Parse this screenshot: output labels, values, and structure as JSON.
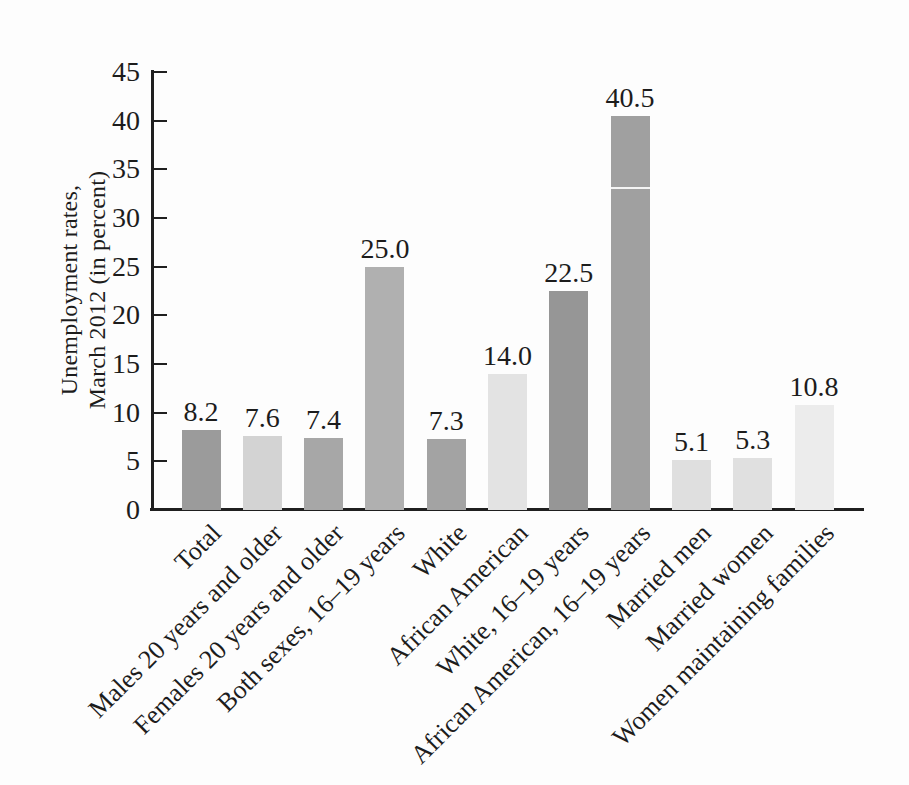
{
  "figure": {
    "background": "#fdfdfd",
    "axis_color": "#1f1f1f",
    "text_color": "#1c1c1c"
  },
  "chart_data": {
    "type": "bar",
    "title": "",
    "xlabel": "",
    "ylabel": "Unemployment rates, March 2012 (in percent)",
    "ylabel_lines": [
      "Unemployment rates,",
      "March 2012 (in percent)"
    ],
    "ylim": [
      0,
      45
    ],
    "ytick_interval": 5,
    "yticks": [
      0,
      5,
      10,
      15,
      20,
      25,
      30,
      35,
      40,
      45
    ],
    "grid": false,
    "legend": "none",
    "categories": [
      "Total",
      "Males 20 years and older",
      "Females 20 years and older",
      "Both sexes, 16–19 years",
      "White",
      "African American",
      "White, 16–19 years",
      "African American, 16–19 years",
      "Married men",
      "Married women",
      "Women maintaining families"
    ],
    "values": [
      8.2,
      7.6,
      7.4,
      25.0,
      7.3,
      14.0,
      22.5,
      40.5,
      5.1,
      5.3,
      10.8
    ],
    "value_labels": [
      "8.2",
      "7.6",
      "7.4",
      "25.0",
      "7.3",
      "14.0",
      "22.5",
      "40.5",
      "5.1",
      "5.3",
      "10.8"
    ],
    "bar_colors": [
      "#9b9b9b",
      "#d3d3d3",
      "#a7a7a7",
      "#b0b0b0",
      "#a3a3a3",
      "#e3e3e3",
      "#969696",
      "#a0a0a0",
      "#dfdfdf",
      "#e0e0e0",
      "#ececec"
    ],
    "scan_artifact": {
      "bar_index": 7,
      "at_value": 33.2,
      "color": "#f4f4f4"
    }
  }
}
